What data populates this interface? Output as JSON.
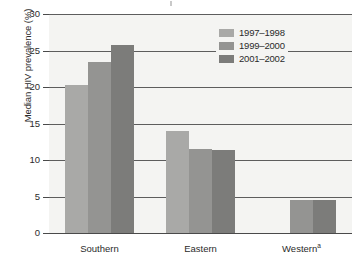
{
  "chart_data": {
    "type": "bar",
    "title": "",
    "subtitle": "",
    "xlabel": "",
    "ylabel": "Median HIV prevalence (%)",
    "categories": [
      "Southern",
      "Eastern",
      "Western"
    ],
    "category_footnotes": [
      "",
      "",
      "a"
    ],
    "series": [
      {
        "name": "1997–1998",
        "color": "#a9a9a7",
        "values": [
          20.3,
          14.0,
          null
        ]
      },
      {
        "name": "1999–2000",
        "color": "#949492",
        "values": [
          23.4,
          11.5,
          4.5
        ]
      },
      {
        "name": "2001–2002",
        "color": "#7c7c7a",
        "values": [
          25.8,
          11.4,
          4.5
        ]
      }
    ],
    "ylim": [
      0,
      30
    ],
    "yticks": [
      0,
      5,
      10,
      15,
      20,
      25,
      30
    ],
    "ytick_labels": [
      "0",
      "5",
      "10",
      "15",
      "20",
      "25",
      "30"
    ],
    "grid": true,
    "grid_axis": "y",
    "legend_position": "top-right",
    "plot_background": "#f4f4f2",
    "axis_color": "#4a4a4a"
  },
  "legend": {
    "entries": [
      {
        "label": "1997–1998"
      },
      {
        "label": "1999–2000"
      },
      {
        "label": "2001–2002"
      }
    ]
  },
  "axes": {
    "y_title": "Median HIV prevalence (%)",
    "y_labels": [
      "30",
      "25",
      "20",
      "15",
      "10",
      "5",
      "0"
    ],
    "x_labels": [
      "Southern",
      "Eastern",
      "Western"
    ],
    "x_footnote_marker": "a"
  }
}
